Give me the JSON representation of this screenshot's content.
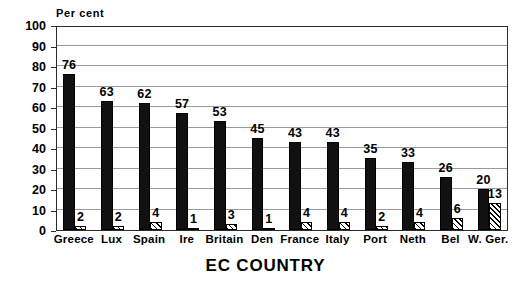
{
  "chart_data": {
    "type": "bar",
    "title": "",
    "ylabel": "Per cent",
    "xlabel": "EC COUNTRY",
    "ylim": [
      0,
      100
    ],
    "yticks": [
      0,
      10,
      20,
      30,
      40,
      50,
      60,
      70,
      80,
      90,
      100
    ],
    "grid": true,
    "legend_position": "none",
    "categories": [
      "Greece",
      "Lux",
      "Spain",
      "Ire",
      "Britain",
      "Den",
      "France",
      "Italy",
      "Port",
      "Neth",
      "Bel",
      "W. Ger."
    ],
    "series": [
      {
        "name": "primary",
        "style": "solid-black",
        "values": [
          76,
          63,
          62,
          57,
          53,
          45,
          43,
          43,
          35,
          33,
          26,
          20
        ]
      },
      {
        "name": "secondary",
        "style": "diagonal-hatch",
        "values": [
          2,
          2,
          4,
          1,
          3,
          1,
          4,
          4,
          2,
          4,
          6,
          13
        ]
      }
    ],
    "data_labels": {
      "primary": [
        "76",
        "63",
        "62",
        "57",
        "53",
        "45",
        "43",
        "43",
        "35",
        "33",
        "26",
        "20"
      ],
      "secondary": [
        "2",
        "2",
        "4",
        "1",
        "3",
        "1",
        "4",
        "4",
        "2",
        "4",
        "6",
        "13"
      ]
    }
  },
  "axis": {
    "y_title": "Per cent",
    "x_title": "EC COUNTRY",
    "y_tick_labels": [
      "100",
      "90",
      "80",
      "70",
      "60",
      "50",
      "40",
      "30",
      "20",
      "10",
      "0"
    ],
    "x_tick_labels": [
      "Greece",
      "Lux",
      "Spain",
      "Ire",
      "Britain",
      "Den",
      "France",
      "Italy",
      "Port",
      "Neth",
      "Bel",
      "W. Ger."
    ]
  },
  "colors": {
    "bar_primary": "#111111",
    "bar_secondary_line": "#000000",
    "bar_secondary_fill": "#ffffff",
    "gridline": "#9a9a9a",
    "frame": "#2b2b2b",
    "background": "#ffffff",
    "text": "#000000"
  }
}
